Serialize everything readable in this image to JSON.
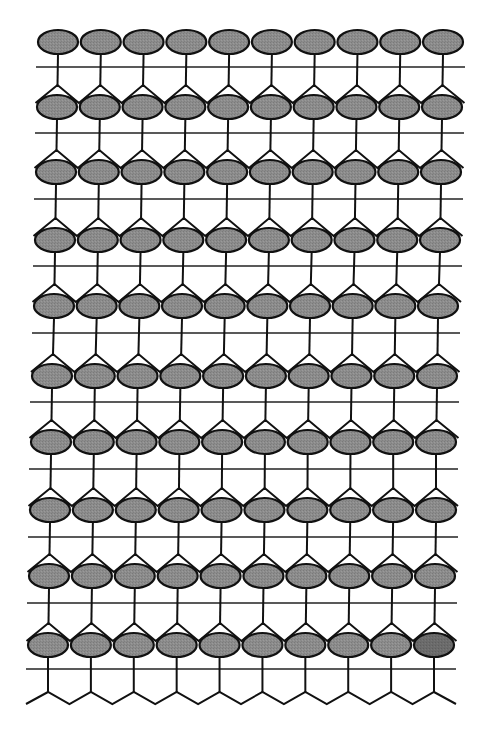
{
  "diagram": {
    "title": "",
    "columns": 10,
    "rows": 10,
    "row_centers_y": [
      42,
      107,
      172,
      240,
      306,
      376,
      442,
      510,
      576,
      645
    ],
    "row_first_x": [
      58,
      57,
      56,
      55,
      54,
      52,
      51,
      50,
      49,
      48
    ],
    "row_last_x": [
      443,
      442,
      441,
      440,
      438,
      437,
      436,
      436,
      435,
      434
    ],
    "hline_y": [
      67,
      133,
      199,
      266,
      333,
      402,
      469,
      537,
      603,
      669
    ],
    "bottom_zigzag": {
      "peak_y": 692,
      "trough_y": 704
    },
    "ellipse": {
      "rx": 20,
      "ry": 12
    },
    "colors": {
      "background": "#ffffff",
      "ellipse_fill": "#8c8c8c",
      "ellipse_fill_highlight": "#6b6b6b",
      "stroke": "#111111",
      "line": "#222222"
    },
    "highlighted": {
      "row": 9,
      "col": 9
    }
  }
}
